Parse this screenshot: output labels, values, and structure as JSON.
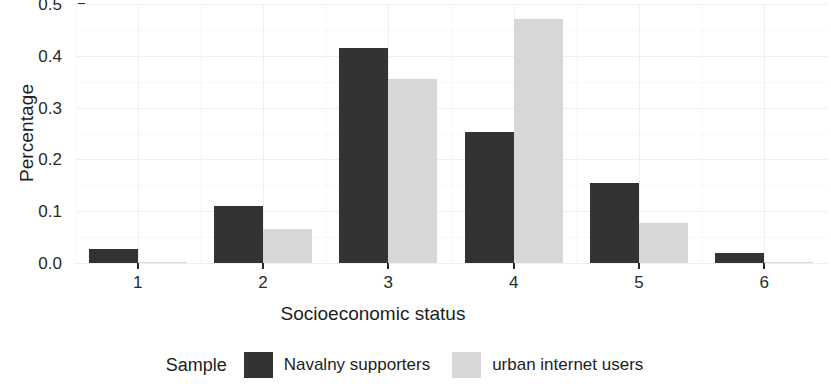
{
  "chart_data": {
    "type": "bar",
    "title": "",
    "xlabel": "Socioeconomic status",
    "ylabel": "Percentage",
    "categories": [
      "1",
      "2",
      "3",
      "4",
      "5",
      "6"
    ],
    "series": [
      {
        "name": "Navalny supporters",
        "color": "#333333",
        "values": [
          0.027,
          0.11,
          0.415,
          0.252,
          0.155,
          0.02
        ]
      },
      {
        "name": "urban internet users",
        "color": "#d7d7d7",
        "values": [
          0.002,
          0.065,
          0.355,
          0.472,
          0.078,
          0.001
        ]
      }
    ],
    "ylim": [
      0.0,
      0.5
    ],
    "yticks": [
      "0.0",
      "0.1",
      "0.2",
      "0.3",
      "0.4",
      "0.5"
    ],
    "ytick_values": [
      0.0,
      0.1,
      0.2,
      0.3,
      0.4,
      0.5
    ],
    "grid": true,
    "legend_position": "bottom",
    "legend_title": "Sample"
  },
  "axis": {
    "y_title": "Percentage",
    "x_title": "Socioeconomic status"
  },
  "legend": {
    "title": "Sample",
    "entries": [
      {
        "label": "Navalny supporters",
        "color": "#333333"
      },
      {
        "label": "urban internet users",
        "color": "#d7d7d7"
      }
    ]
  }
}
